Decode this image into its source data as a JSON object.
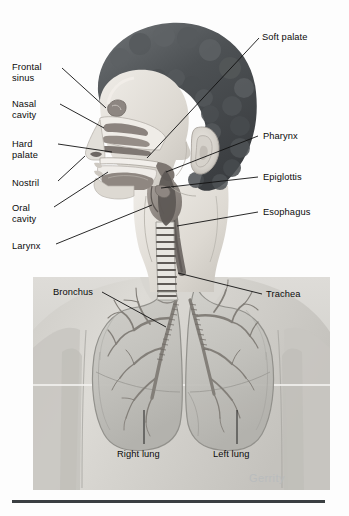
{
  "figure": {
    "signature": "Gerrity",
    "colors": {
      "label_text": "#0b0b0b",
      "leader_line": "#111111",
      "signature": "#b9bcbd",
      "rule": "#3b3f42",
      "hair_dark": "#4a4d50",
      "hair_mid": "#6e7275",
      "skin_light": "#e6e3dd",
      "skin_mid": "#cfcbc4",
      "mucosa_dark": "#7b7470",
      "mucosa_mid": "#9a938d",
      "cavity_white": "#f4f2ee",
      "photo_bg": "#d3d2ce",
      "lung_fill": "#c6c5c0",
      "lung_edge": "#8e8d88",
      "bronchus": "#8a8883"
    },
    "labels_left": [
      {
        "id": "frontal-sinus",
        "text": "Frontal\nsinus",
        "x": 12,
        "y": 62,
        "lx": 62,
        "ly": 68,
        "tx": 106,
        "ty": 108
      },
      {
        "id": "nasal-cavity",
        "text": "Nasal\ncavity",
        "x": 12,
        "y": 99,
        "lx": 60,
        "ly": 104,
        "tx": 104,
        "ty": 128
      },
      {
        "id": "hard-palate",
        "text": "Hard\npalate",
        "x": 12,
        "y": 139,
        "lx": 58,
        "ly": 144,
        "tx": 112,
        "ty": 152
      },
      {
        "id": "nostril",
        "text": "Nostril",
        "x": 12,
        "y": 178,
        "lx": 58,
        "ly": 181,
        "tx": 85,
        "ty": 156
      },
      {
        "id": "oral-cavity",
        "text": "Oral\ncavity",
        "x": 12,
        "y": 203,
        "lx": 54,
        "ly": 207,
        "tx": 108,
        "ty": 172
      },
      {
        "id": "larynx",
        "text": "Larynx",
        "x": 12,
        "y": 241,
        "lx": 56,
        "ly": 244,
        "tx": 152,
        "ty": 205
      }
    ],
    "labels_right": [
      {
        "id": "soft-palate",
        "text": "Soft palate",
        "x": 262,
        "y": 32,
        "lx": 259,
        "ly": 38,
        "tx": 147,
        "ty": 158
      },
      {
        "id": "pharynx",
        "text": "Pharynx",
        "x": 263,
        "y": 131,
        "lx": 258,
        "ly": 136,
        "tx": 166,
        "ty": 172
      },
      {
        "id": "epiglottis",
        "text": "Epiglottis",
        "x": 263,
        "y": 172,
        "lx": 258,
        "ly": 177,
        "tx": 161,
        "ty": 188
      },
      {
        "id": "esophagus",
        "text": "Esophagus",
        "x": 263,
        "y": 207,
        "lx": 258,
        "ly": 212,
        "tx": 177,
        "ty": 226
      },
      {
        "id": "trachea",
        "text": "Trachea",
        "x": 266,
        "y": 289,
        "lx": 262,
        "ly": 294,
        "tx": 178,
        "ty": 273
      }
    ],
    "labels_inner": [
      {
        "id": "bronchus",
        "text": "Bronchus",
        "x": 53,
        "y": 287,
        "lx": 102,
        "ly": 292,
        "tx": 166,
        "ty": 327
      }
    ],
    "labels_bottom": [
      {
        "id": "right-lung",
        "text": "Right lung",
        "x": 117,
        "y": 449,
        "lx": 144,
        "ly": 410,
        "tx": 144,
        "ty": 444
      },
      {
        "id": "left-lung",
        "text": "Left lung",
        "x": 213,
        "y": 449,
        "lx": 237,
        "ly": 410,
        "tx": 237,
        "ty": 444
      }
    ],
    "rule": {
      "x": 12,
      "y": 500,
      "width": 313,
      "height": 3
    },
    "signature_pos": {
      "x": 249,
      "y": 478
    },
    "photo_panel": {
      "x": 33,
      "y": 277,
      "width": 297,
      "height": 213
    }
  }
}
